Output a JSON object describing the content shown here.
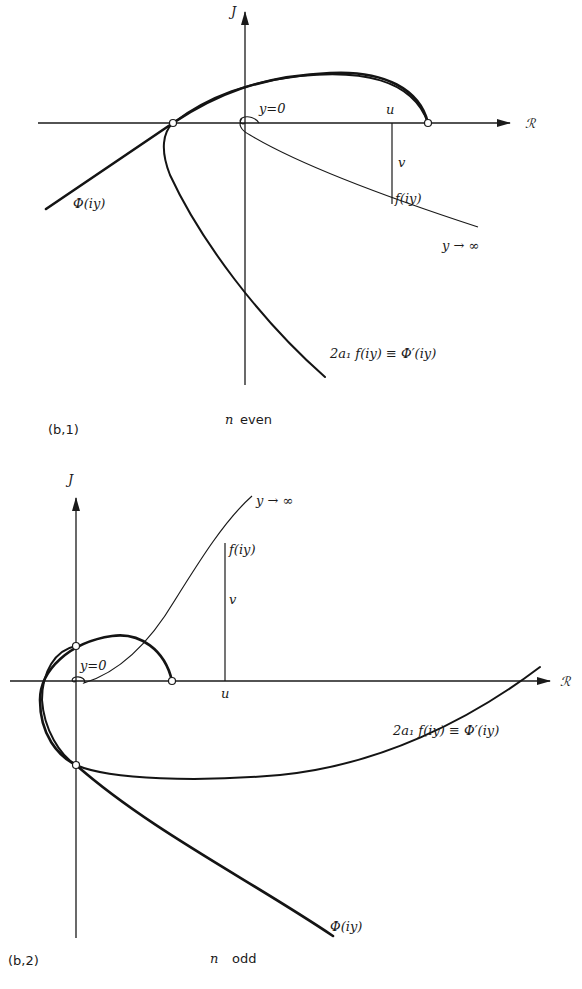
{
  "figure": {
    "panel_1": {
      "id_label": "(b,1)",
      "caption_n": "n",
      "caption_parity": "even",
      "axis_imag": "J",
      "axis_real": "ℛ",
      "label_y0": "y=0",
      "label_u": "u",
      "label_v": "v",
      "label_f": "f(iy)",
      "label_yinf": "y → ∞",
      "label_phi": "Φ(iy)",
      "label_deriv": "2a₁ f(iy) ≡ Φ′(iy)"
    },
    "panel_2": {
      "id_label": "(b,2)",
      "caption_n": "n",
      "caption_parity": "odd",
      "axis_imag": "J",
      "axis_real": "ℛ",
      "label_y0": "y=0",
      "label_u": "u",
      "label_v": "v",
      "label_f": "f(iy)",
      "label_yinf": "y → ∞",
      "label_phi": "Φ(iy)",
      "label_deriv": "2a₁ f(iy) ≡ Φ′(iy)"
    }
  }
}
